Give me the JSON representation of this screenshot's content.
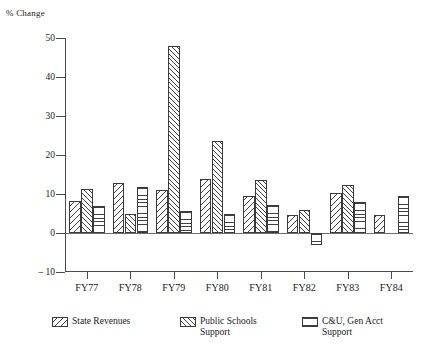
{
  "chart_data": {
    "type": "bar",
    "title": "",
    "xlabel": "",
    "ylabel": "% Change",
    "ylim": [
      -10,
      50
    ],
    "yticks": [
      50,
      40,
      30,
      20,
      10,
      0,
      -10
    ],
    "ytick_labels": [
      "50",
      "40",
      "30",
      "20",
      "10",
      "0",
      "– 10"
    ],
    "grid": false,
    "legend_position": "bottom",
    "categories": [
      "FY77",
      "FY78",
      "FY79",
      "FY80",
      "FY81",
      "FY82",
      "FY83",
      "FY84"
    ],
    "series": [
      {
        "name": "State Revenues",
        "pattern": "backslash-hatch",
        "values": [
          8.3,
          12.7,
          11.0,
          13.8,
          9.5,
          4.5,
          10.2,
          4.5
        ]
      },
      {
        "name": "Public Schools\nSupport",
        "pattern": "forwardslash-hatch",
        "values": [
          11.2,
          4.8,
          48.0,
          23.5,
          13.7,
          6.0,
          12.3,
          null
        ]
      },
      {
        "name": "C&U, Gen Acct\nSupport",
        "pattern": "horizontal-stripe",
        "values": [
          6.8,
          11.7,
          5.7,
          5.0,
          7.2,
          -3.0,
          8.0,
          9.5
        ]
      }
    ]
  },
  "colors": {
    "axis": "#4a4a4a",
    "zero_line": "#6e6e6e",
    "bar_outline": "#3a3a3a",
    "hatch": "#3f3f3f",
    "background": "#ffffff"
  }
}
